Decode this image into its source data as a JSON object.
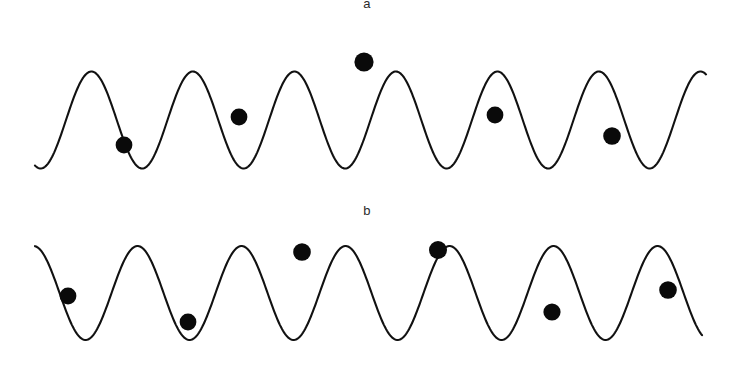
{
  "figure": {
    "background_color": "#ffffff",
    "stroke_color": "#111111",
    "particle_color": "#0a0a0a",
    "panels": [
      {
        "id": "a",
        "label": "a",
        "label_position": "top-center"
      },
      {
        "id": "b",
        "label": "b",
        "label_position": "top-center"
      }
    ]
  },
  "chart_data": {
    "type": "line",
    "title": "",
    "xlabel": "",
    "ylabel": "",
    "grid": false,
    "legend": null,
    "panels": [
      {
        "name": "a",
        "label": "a",
        "description": "Sinusoidal wave with five filled circular markers at differing phase positions",
        "wave": {
          "x_start": 35,
          "x_end": 706,
          "baseline_y": 120,
          "amplitude": 48.5,
          "peak_y": 71,
          "trough_y": 168,
          "cycles": 6.6,
          "wavelength": 101.5,
          "phase_deg": 250,
          "stroke_width": 2.1
        },
        "markers": [
          {
            "index": 1,
            "x": 124,
            "y": 145,
            "r": 8.4,
            "position": "near trough"
          },
          {
            "index": 2,
            "x": 239,
            "y": 117,
            "r": 8.4,
            "position": "rising flank"
          },
          {
            "index": 3,
            "x": 364,
            "y": 62,
            "r": 9.6,
            "position": "at crest"
          },
          {
            "index": 4,
            "x": 495,
            "y": 115,
            "r": 8.4,
            "position": "falling flank"
          },
          {
            "index": 5,
            "x": 612,
            "y": 136,
            "r": 8.8,
            "position": "lower flank near trough"
          }
        ]
      },
      {
        "name": "b",
        "label": "b",
        "description": "Sinusoidal wave with six filled circular markers at differing phase positions",
        "wave": {
          "x_start": 35,
          "x_end": 702,
          "baseline_y": 293,
          "amplitude": 47,
          "peak_y": 246,
          "trough_y": 340,
          "cycles": 6.4,
          "wavelength": 104,
          "phase_deg": 95,
          "stroke_width": 2.1
        },
        "markers": [
          {
            "index": 1,
            "x": 68,
            "y": 296,
            "r": 8.4,
            "position": "falling flank"
          },
          {
            "index": 2,
            "x": 188,
            "y": 322,
            "r": 8.4,
            "position": "near trough"
          },
          {
            "index": 3,
            "x": 302,
            "y": 252,
            "r": 8.8,
            "position": "near crest left flank"
          },
          {
            "index": 4,
            "x": 438,
            "y": 250,
            "r": 9.0,
            "position": "near crest right flank"
          },
          {
            "index": 5,
            "x": 552,
            "y": 312,
            "r": 8.6,
            "position": "lower flank"
          },
          {
            "index": 6,
            "x": 668,
            "y": 290,
            "r": 8.8,
            "position": "rising flank"
          }
        ]
      }
    ]
  }
}
